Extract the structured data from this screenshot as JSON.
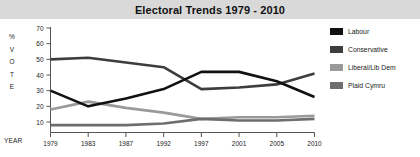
{
  "header": {
    "title": "Electoral Trends 1979 - 2010"
  },
  "axes": {
    "y_axis_label_chars": [
      "%",
      "V",
      "O",
      "T",
      "E"
    ],
    "x_axis_label": "YEAR"
  },
  "legend": {
    "position": "right",
    "items": [
      {
        "label": "Labour",
        "color": "#111111"
      },
      {
        "label": "Conservative",
        "color": "#3d3d3d"
      },
      {
        "label": "Liberal/Lib Dem",
        "color": "#9a9a9a"
      },
      {
        "label": "Plaid Cymru",
        "color": "#6e6e6e"
      }
    ]
  },
  "chart_data": {
    "type": "line",
    "title": "Electoral Trends 1979 - 2010",
    "xlabel": "YEAR",
    "ylabel": "% VOTE",
    "categories": [
      "1979",
      "1983",
      "1987",
      "1992",
      "1997",
      "2001",
      "2005",
      "2010"
    ],
    "x": [
      1979,
      1983,
      1987,
      1992,
      1997,
      2001,
      2005,
      2010
    ],
    "ylim": [
      0,
      70
    ],
    "yticks": [
      10,
      20,
      30,
      40,
      50,
      60,
      70
    ],
    "ytick_labels": [
      "10",
      "20",
      "30",
      "40",
      "50",
      "60",
      "70"
    ],
    "grid": false,
    "series": [
      {
        "name": "Labour",
        "color": "#111111",
        "values": [
          30,
          20,
          25,
          31,
          42,
          42,
          36,
          26
        ]
      },
      {
        "name": "Conservative",
        "color": "#3d3d3d",
        "values": [
          50,
          51,
          48,
          45,
          31,
          32,
          34,
          41
        ]
      },
      {
        "name": "Liberal/Lib Dem",
        "color": "#9a9a9a",
        "values": [
          18,
          23,
          19,
          16,
          12,
          13,
          13,
          14
        ]
      },
      {
        "name": "Plaid Cymru",
        "color": "#6e6e6e",
        "values": [
          8,
          8,
          8,
          9,
          12,
          11,
          11,
          12
        ]
      }
    ]
  }
}
